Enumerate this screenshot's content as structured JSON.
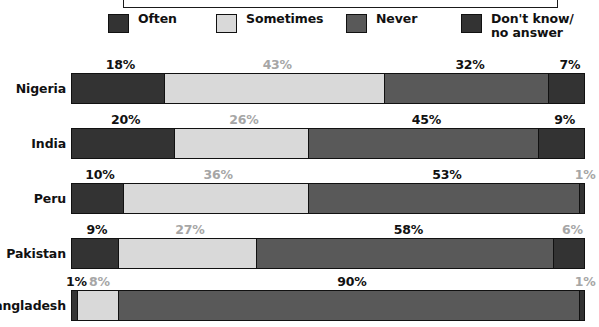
{
  "legend": {
    "items": [
      {
        "label": "Often",
        "color": "#333333",
        "icon": "legend-swatch-often"
      },
      {
        "label": "Sometimes",
        "color": "#d9d9d9",
        "icon": "legend-swatch-sometimes"
      },
      {
        "label": "Never",
        "color": "#595959",
        "icon": "legend-swatch-never"
      },
      {
        "label": "Don't know/\nno answer",
        "color": "#333333",
        "icon": "legend-swatch-dont-know"
      }
    ]
  },
  "chart_data": {
    "type": "bar",
    "orientation": "horizontal",
    "stacked": true,
    "title": "",
    "xlabel": "",
    "ylabel": "",
    "xlim": [
      0,
      100
    ],
    "grid": false,
    "legend_position": "top",
    "categories": [
      "Nigeria",
      "India",
      "Peru",
      "Pakistan",
      "Bangladesh"
    ],
    "series": [
      {
        "name": "Often",
        "color": "#333333",
        "values": [
          18,
          20,
          10,
          9,
          1
        ]
      },
      {
        "name": "Sometimes",
        "color": "#d9d9d9",
        "values": [
          43,
          26,
          36,
          27,
          8
        ]
      },
      {
        "name": "Never",
        "color": "#595959",
        "values": [
          32,
          45,
          53,
          58,
          90
        ]
      },
      {
        "name": "Don't know/no answer",
        "color": "#333333",
        "values": [
          7,
          9,
          1,
          6,
          1
        ]
      }
    ],
    "rows": [
      {
        "label": "Nigeria",
        "segments": [
          {
            "series": "Often",
            "value": 18,
            "label": "18%",
            "label_style": "dark"
          },
          {
            "series": "Sometimes",
            "value": 43,
            "label": "43%",
            "label_style": "light"
          },
          {
            "series": "Never",
            "value": 32,
            "label": "32%",
            "label_style": "dark"
          },
          {
            "series": "Don't know/no answer",
            "value": 7,
            "label": "7%",
            "label_style": "dark"
          }
        ]
      },
      {
        "label": "India",
        "segments": [
          {
            "series": "Often",
            "value": 20,
            "label": "20%",
            "label_style": "dark"
          },
          {
            "series": "Sometimes",
            "value": 26,
            "label": "26%",
            "label_style": "light"
          },
          {
            "series": "Never",
            "value": 45,
            "label": "45%",
            "label_style": "dark"
          },
          {
            "series": "Don't know/no answer",
            "value": 9,
            "label": "9%",
            "label_style": "dark"
          }
        ]
      },
      {
        "label": "Peru",
        "segments": [
          {
            "series": "Often",
            "value": 10,
            "label": "10%",
            "label_style": "dark"
          },
          {
            "series": "Sometimes",
            "value": 36,
            "label": "36%",
            "label_style": "light"
          },
          {
            "series": "Never",
            "value": 53,
            "label": "53%",
            "label_style": "dark"
          },
          {
            "series": "Don't know/no answer",
            "value": 1,
            "label": "1%",
            "label_style": "light"
          }
        ]
      },
      {
        "label": "Pakistan",
        "segments": [
          {
            "series": "Often",
            "value": 9,
            "label": "9%",
            "label_style": "dark"
          },
          {
            "series": "Sometimes",
            "value": 27,
            "label": "27%",
            "label_style": "light"
          },
          {
            "series": "Never",
            "value": 58,
            "label": "58%",
            "label_style": "dark"
          },
          {
            "series": "Don't know/no answer",
            "value": 6,
            "label": "6%",
            "label_style": "light"
          }
        ]
      },
      {
        "label": "Bangladesh",
        "segments": [
          {
            "series": "Often",
            "value": 1,
            "label": "1%",
            "label_style": "dark"
          },
          {
            "series": "Sometimes",
            "value": 8,
            "label": "8%",
            "label_style": "light"
          },
          {
            "series": "Never",
            "value": 90,
            "label": "90%",
            "label_style": "dark"
          },
          {
            "series": "Don't know/no answer",
            "value": 1,
            "label": "1%",
            "label_style": "light"
          }
        ]
      }
    ]
  }
}
